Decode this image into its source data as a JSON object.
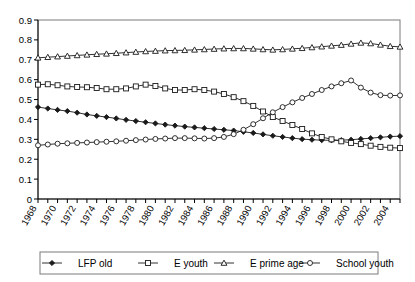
{
  "chart_data": {
    "type": "line",
    "title": "",
    "xlabel": "",
    "ylabel": "",
    "xlim": [
      1968,
      2005
    ],
    "ylim": [
      0,
      0.9
    ],
    "grid": false,
    "legend_position": "bottom",
    "ytick_labels": [
      "0",
      "0.1",
      "0.2",
      "0.3",
      "0.4",
      "0.5",
      "0.6",
      "0.7",
      "0.8",
      "0.9"
    ],
    "ytick_values": [
      0,
      0.1,
      0.2,
      0.3,
      0.4,
      0.5,
      0.6,
      0.7,
      0.8,
      0.9
    ],
    "xtick_labels": [
      "1968",
      "1970",
      "1972",
      "1974",
      "1976",
      "1978",
      "1980",
      "1982",
      "1984",
      "1986",
      "1988",
      "1990",
      "1992",
      "1994",
      "1996",
      "1998",
      "2000",
      "2002",
      "2004"
    ],
    "x": [
      1968,
      1969,
      1970,
      1971,
      1972,
      1973,
      1974,
      1975,
      1976,
      1977,
      1978,
      1979,
      1980,
      1981,
      1982,
      1983,
      1984,
      1985,
      1986,
      1987,
      1988,
      1989,
      1990,
      1991,
      1992,
      1993,
      1994,
      1995,
      1996,
      1997,
      1998,
      1999,
      2000,
      2001,
      2002,
      2003,
      2004,
      2005
    ],
    "series": [
      {
        "name": "LFP old",
        "marker": "filled-diamond",
        "values": [
          0.462,
          0.455,
          0.448,
          0.442,
          0.434,
          0.425,
          0.418,
          0.412,
          0.405,
          0.398,
          0.392,
          0.386,
          0.38,
          0.374,
          0.369,
          0.364,
          0.36,
          0.356,
          0.352,
          0.348,
          0.344,
          0.338,
          0.332,
          0.325,
          0.318,
          0.312,
          0.306,
          0.301,
          0.298,
          0.296,
          0.295,
          0.296,
          0.298,
          0.302,
          0.306,
          0.31,
          0.314,
          0.316
        ]
      },
      {
        "name": "E youth",
        "marker": "open-square",
        "values": [
          0.575,
          0.577,
          0.572,
          0.566,
          0.563,
          0.562,
          0.558,
          0.552,
          0.552,
          0.556,
          0.566,
          0.575,
          0.568,
          0.556,
          0.548,
          0.548,
          0.552,
          0.548,
          0.54,
          0.528,
          0.512,
          0.492,
          0.468,
          0.44,
          0.412,
          0.392,
          0.372,
          0.352,
          0.33,
          0.312,
          0.3,
          0.29,
          0.282,
          0.276,
          0.268,
          0.262,
          0.258,
          0.256
        ]
      },
      {
        "name": "E prime age",
        "marker": "open-triangle",
        "values": [
          0.71,
          0.713,
          0.716,
          0.719,
          0.722,
          0.725,
          0.728,
          0.73,
          0.733,
          0.736,
          0.739,
          0.742,
          0.744,
          0.746,
          0.747,
          0.748,
          0.75,
          0.752,
          0.754,
          0.756,
          0.757,
          0.757,
          0.755,
          0.752,
          0.75,
          0.752,
          0.755,
          0.758,
          0.762,
          0.766,
          0.77,
          0.774,
          0.78,
          0.785,
          0.782,
          0.775,
          0.768,
          0.765
        ]
      },
      {
        "name": "School youth",
        "marker": "open-circle",
        "values": [
          0.27,
          0.274,
          0.278,
          0.28,
          0.282,
          0.284,
          0.286,
          0.288,
          0.29,
          0.293,
          0.296,
          0.299,
          0.302,
          0.304,
          0.306,
          0.306,
          0.305,
          0.304,
          0.306,
          0.312,
          0.326,
          0.348,
          0.376,
          0.406,
          0.436,
          0.462,
          0.486,
          0.508,
          0.528,
          0.548,
          0.566,
          0.582,
          0.596,
          0.606,
          0.612,
          0.61,
          0.6,
          0.588
        ]
      }
    ],
    "series_tail": {
      "School youth": [
        0.56,
        0.535,
        0.522,
        0.52,
        0.521
      ]
    }
  },
  "legend": {
    "entries": [
      {
        "label": "LFP old",
        "marker": "filled-diamond"
      },
      {
        "label": "E youth",
        "marker": "open-square"
      },
      {
        "label": "E prime age",
        "marker": "open-triangle"
      },
      {
        "label": "School youth",
        "marker": "open-circle"
      }
    ]
  }
}
